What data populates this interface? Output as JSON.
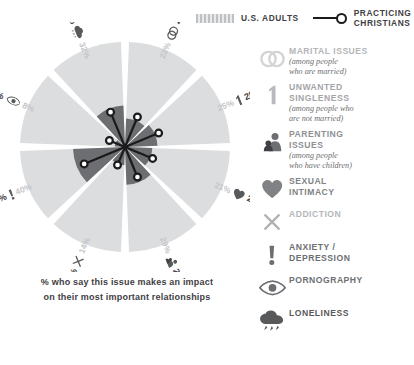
{
  "legend": {
    "us_adults_label": "U.S. ADULTS",
    "practicing_label": "PRACTICING\nCHRISTIANS",
    "us_adults_color": "#c6c7c9",
    "practicing_color": "#1b1b1b"
  },
  "caption": {
    "line1": "% who say this issue makes an impact",
    "line2": "on their most important relationships"
  },
  "categories": [
    {
      "id": "marital",
      "icon": "wedding-rings-icon",
      "name": "MARITAL ISSUES",
      "sub": "(among people\nwho are married)",
      "name_color": "#b4b6b9",
      "icon_color": "#d3d4d6"
    },
    {
      "id": "singleness",
      "icon": "single-person-icon",
      "name": "UNWANTED\nSINGLENESS",
      "sub": "(among people who\nare not married)",
      "name_color": "#a3a5a8",
      "icon_color": "#b8babd"
    },
    {
      "id": "parenting",
      "icon": "parent-child-icon",
      "name": "PARENTING\nISSUES",
      "sub": "(among people\nwho have children)",
      "name_color": "#8e9094",
      "icon_color": "#6d6e71"
    },
    {
      "id": "sexual",
      "icon": "heart-icon",
      "name": "SEXUAL\nINTIMACY",
      "sub": "",
      "name_color": "#808285",
      "icon_color": "#808285"
    },
    {
      "id": "addiction",
      "icon": "x-cross-icon",
      "name": "ADDICTION",
      "sub": "",
      "name_color": "#b4b6b9",
      "icon_color": "#b0b2b5"
    },
    {
      "id": "anxiety",
      "icon": "exclamation-icon",
      "name": "ANXIETY /\nDEPRESSION",
      "sub": "",
      "name_color": "#6d6e71",
      "icon_color": "#6d6e71"
    },
    {
      "id": "pornography",
      "icon": "eye-icon",
      "name": "PORNOGRAPHY",
      "sub": "",
      "name_color": "#6d6e71",
      "icon_color": "#6d6e71"
    },
    {
      "id": "loneliness",
      "icon": "rain-cloud-icon",
      "name": "LONELINESS",
      "sub": "",
      "name_color": "#58595b",
      "icon_color": "#58595b"
    }
  ],
  "chart_data": {
    "type": "pie",
    "title": "% who say this issue makes an impact on their most important relationships",
    "legend_position": "top-right",
    "series": [
      {
        "name": "U.S. ADULTS",
        "color": "#c6c7c9"
      },
      {
        "name": "PRACTICING CHRISTIANS",
        "color": "#1b1b1b"
      }
    ],
    "categories": [
      "MARITAL ISSUES",
      "UNWANTED SINGLENESS",
      "SEXUAL INTIMACY",
      "PARENTING ISSUES",
      "ADDICTION",
      "ANXIETY / DEPRESSION",
      "PORNOGRAPHY",
      "LONELINESS"
    ],
    "slices": [
      {
        "label": "MARITAL ISSUES",
        "icon": "wedding-rings-icon",
        "us_adults": 22,
        "practicing_christians": 25,
        "us_adults_text": "22%",
        "practicing_text": "25%",
        "angle_start": -90,
        "angle_end": -45
      },
      {
        "label": "UNWANTED SINGLENESS",
        "icon": "single-person-icon",
        "us_adults": 25,
        "practicing_christians": 28,
        "us_adults_text": "25%",
        "practicing_text": "28%",
        "angle_start": -45,
        "angle_end": 0
      },
      {
        "label": "SEXUAL INTIMACY",
        "icon": "heart-icon",
        "us_adults": 21,
        "practicing_christians": 23,
        "us_adults_text": "21%",
        "practicing_text": "23%",
        "angle_start": 0,
        "angle_end": 45
      },
      {
        "label": "PARENTING ISSUES",
        "icon": "parent-child-icon",
        "us_adults": 29,
        "practicing_christians": 25,
        "us_adults_text": "29%",
        "practicing_text": "25%",
        "angle_start": 45,
        "angle_end": 90
      },
      {
        "label": "ADDICTION",
        "icon": "x-cross-icon",
        "us_adults": 14,
        "practicing_christians": 15,
        "us_adults_text": "14%",
        "practicing_text": "15%",
        "angle_start": 90,
        "angle_end": 135
      },
      {
        "label": "ANXIETY / DEPRESSION",
        "icon": "exclamation-icon",
        "us_adults": 40,
        "practicing_christians": 34,
        "us_adults_text": "40%",
        "practicing_text": "34%",
        "angle_start": 135,
        "angle_end": 180
      },
      {
        "label": "PORNOGRAPHY",
        "icon": "eye-icon",
        "us_adults": 8,
        "practicing_christians": 13,
        "us_adults_text": "8%",
        "practicing_text": "13%",
        "angle_start": 180,
        "angle_end": 225
      },
      {
        "label": "LONELINESS",
        "icon": "rain-cloud-icon",
        "us_adults": 32,
        "practicing_christians": 29,
        "us_adults_text": "32%",
        "practicing_text": "29%",
        "angle_start": 225,
        "angle_end": 270
      }
    ],
    "max_value": 40,
    "outer_ring_color": "#dcdddf",
    "inner_wedge_color": "#6d6e71"
  }
}
